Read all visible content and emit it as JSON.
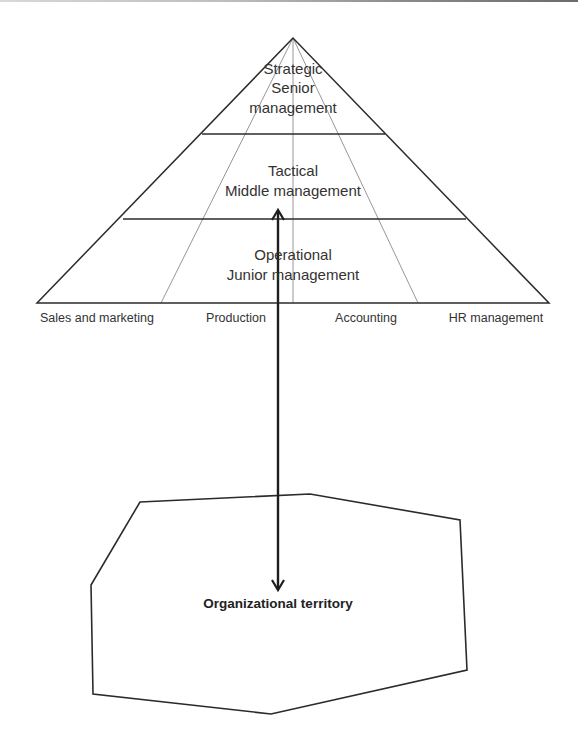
{
  "diagram": {
    "type": "hierarchy-pyramid-with-territory",
    "pyramid": {
      "tiers": [
        {
          "level": "Strategic",
          "role_line1": "Senior",
          "role_line2": "management"
        },
        {
          "level": "Tactical",
          "role": "Middle management"
        },
        {
          "level": "Operational",
          "role": "Junior management"
        }
      ],
      "departments": [
        "Sales and marketing",
        "Production",
        "Accounting",
        "HR management"
      ]
    },
    "arrow": {
      "style": "double-headed",
      "connects": [
        "Tactical tier",
        "Organizational territory"
      ]
    },
    "territory": {
      "label": "Organizational territory"
    },
    "colors": {
      "stroke": "#2b2b2b",
      "fan_lines": "#8a8a8a",
      "text": "#333333",
      "background": "#ffffff"
    }
  }
}
